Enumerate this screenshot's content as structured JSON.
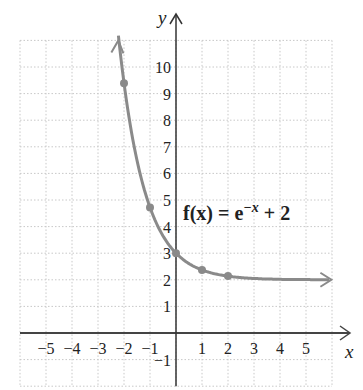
{
  "chart_data": {
    "type": "line",
    "title": "",
    "function_label": "f(x) = e^{-x} + 2",
    "equation": {
      "lhs": "f(x) = e",
      "exp": "−x",
      "rhs": " + 2"
    },
    "xlabel": "x",
    "ylabel": "y",
    "xlim": [
      -6,
      6
    ],
    "ylim": [
      -2,
      11
    ],
    "grid": true,
    "x_ticks": [
      "-5",
      "-4",
      "-3",
      "-2",
      "-1",
      "1",
      "2",
      "3",
      "4",
      "5"
    ],
    "y_ticks": [
      "-1",
      "1",
      "2",
      "3",
      "4",
      "5",
      "6",
      "7",
      "8",
      "9",
      "10"
    ],
    "points": [
      {
        "x": -2,
        "y": 9.39
      },
      {
        "x": -1,
        "y": 4.72
      },
      {
        "x": 0,
        "y": 3
      },
      {
        "x": 1,
        "y": 2.37
      },
      {
        "x": 2,
        "y": 2.14
      }
    ],
    "asymptote": 2,
    "curve_color": "#8a8a8a"
  }
}
